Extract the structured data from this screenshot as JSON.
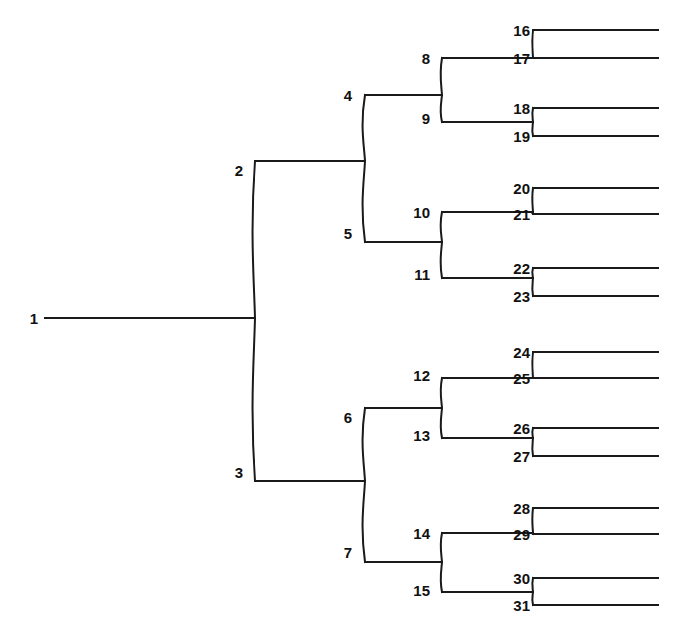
{
  "figure": {
    "kind": "binary-tree-diagram",
    "line_color": "#1a1a1a",
    "background_color": "#ffffff",
    "label_color": "#111111",
    "top_artifact_text": "a page of text cut off at the top edge"
  },
  "nodes": [
    {
      "id": "n1",
      "label": "1",
      "x": 45,
      "y": 318,
      "level": 0,
      "type": "root",
      "label_x": 38,
      "label_y": 318
    },
    {
      "id": "n2",
      "label": "2",
      "x": 255,
      "y": 161,
      "level": 1,
      "type": "internal",
      "label_x": 243,
      "label_y": 170
    },
    {
      "id": "n3",
      "label": "3",
      "x": 255,
      "y": 481,
      "level": 1,
      "type": "internal",
      "label_x": 243,
      "label_y": 472
    },
    {
      "id": "n4",
      "label": "4",
      "x": 365,
      "y": 95,
      "level": 2,
      "type": "internal",
      "label_x": 352,
      "label_y": 95
    },
    {
      "id": "n5",
      "label": "5",
      "x": 365,
      "y": 242,
      "level": 2,
      "type": "internal",
      "label_x": 352,
      "label_y": 233
    },
    {
      "id": "n6",
      "label": "6",
      "x": 365,
      "y": 408,
      "level": 2,
      "type": "internal",
      "label_x": 352,
      "label_y": 417
    },
    {
      "id": "n7",
      "label": "7",
      "x": 365,
      "y": 562,
      "level": 2,
      "type": "internal",
      "label_x": 352,
      "label_y": 552
    },
    {
      "id": "n8",
      "label": "8",
      "x": 442,
      "y": 58,
      "level": 3,
      "type": "internal",
      "label_x": 430,
      "label_y": 58
    },
    {
      "id": "n9",
      "label": "9",
      "x": 442,
      "y": 122,
      "level": 3,
      "type": "internal",
      "label_x": 430,
      "label_y": 118
    },
    {
      "id": "n10",
      "label": "10",
      "x": 442,
      "y": 212,
      "level": 3,
      "type": "internal",
      "label_x": 430,
      "label_y": 212
    },
    {
      "id": "n11",
      "label": "11",
      "x": 442,
      "y": 278,
      "level": 3,
      "type": "internal",
      "label_x": 430,
      "label_y": 274
    },
    {
      "id": "n12",
      "label": "12",
      "x": 442,
      "y": 378,
      "level": 3,
      "type": "internal",
      "label_x": 430,
      "label_y": 375
    },
    {
      "id": "n13",
      "label": "13",
      "x": 442,
      "y": 438,
      "level": 3,
      "type": "internal",
      "label_x": 430,
      "label_y": 435
    },
    {
      "id": "n14",
      "label": "14",
      "x": 442,
      "y": 533,
      "level": 3,
      "type": "internal",
      "label_x": 430,
      "label_y": 533
    },
    {
      "id": "n15",
      "label": "15",
      "x": 442,
      "y": 592,
      "level": 3,
      "type": "internal",
      "label_x": 430,
      "label_y": 590
    }
  ],
  "leaves": [
    {
      "id": "n16",
      "label": "16",
      "y": 30,
      "parent": "n8",
      "label_x": 530,
      "label_y": 30
    },
    {
      "id": "n17",
      "label": "17",
      "y": 58,
      "parent": "n8",
      "label_x": 530,
      "label_y": 58
    },
    {
      "id": "n18",
      "label": "18",
      "y": 108,
      "parent": "n9",
      "label_x": 530,
      "label_y": 108
    },
    {
      "id": "n19",
      "label": "19",
      "y": 136,
      "parent": "n9",
      "label_x": 530,
      "label_y": 136
    },
    {
      "id": "n20",
      "label": "20",
      "y": 188,
      "parent": "n10",
      "label_x": 530,
      "label_y": 188
    },
    {
      "id": "n21",
      "label": "21",
      "y": 214,
      "parent": "n10",
      "label_x": 530,
      "label_y": 214
    },
    {
      "id": "n22",
      "label": "22",
      "y": 268,
      "parent": "n11",
      "label_x": 530,
      "label_y": 268
    },
    {
      "id": "n23",
      "label": "23",
      "y": 296,
      "parent": "n11",
      "label_x": 530,
      "label_y": 296
    },
    {
      "id": "n24",
      "label": "24",
      "y": 352,
      "parent": "n12",
      "label_x": 530,
      "label_y": 352
    },
    {
      "id": "n25",
      "label": "25",
      "y": 378,
      "parent": "n12",
      "label_x": 530,
      "label_y": 378
    },
    {
      "id": "n26",
      "label": "26",
      "y": 428,
      "parent": "n13",
      "label_x": 530,
      "label_y": 428
    },
    {
      "id": "n27",
      "label": "27",
      "y": 456,
      "parent": "n13",
      "label_x": 530,
      "label_y": 456
    },
    {
      "id": "n28",
      "label": "28",
      "y": 508,
      "parent": "n14",
      "label_x": 530,
      "label_y": 508
    },
    {
      "id": "n29",
      "label": "29",
      "y": 534,
      "parent": "n14",
      "label_x": 530,
      "label_y": 534
    },
    {
      "id": "n30",
      "label": "30",
      "y": 578,
      "parent": "n15",
      "label_x": 530,
      "label_y": 578
    },
    {
      "id": "n31",
      "label": "31",
      "y": 605,
      "parent": "n15",
      "label_x": 530,
      "label_y": 605
    }
  ],
  "edges": [
    {
      "from": "1",
      "to": "2,3",
      "stem_x1": 45,
      "stem_x2": 255,
      "stem_y": 318,
      "bar_x": 255,
      "bar_y1": 161,
      "bar_y2": 481
    },
    {
      "from": "2",
      "to": "4,5",
      "stem_x1": 255,
      "stem_x2": 365,
      "stem_y": 161,
      "bar_x": 365,
      "bar_y1": 95,
      "bar_y2": 242
    },
    {
      "from": "3",
      "to": "6,7",
      "stem_x1": 255,
      "stem_x2": 365,
      "stem_y": 481,
      "bar_x": 365,
      "bar_y1": 408,
      "bar_y2": 562
    },
    {
      "from": "4",
      "to": "8,9",
      "stem_x1": 365,
      "stem_x2": 442,
      "stem_y": 95,
      "bar_x": 442,
      "bar_y1": 58,
      "bar_y2": 122
    },
    {
      "from": "5",
      "to": "10,11",
      "stem_x1": 365,
      "stem_x2": 442,
      "stem_y": 242,
      "bar_x": 442,
      "bar_y1": 212,
      "bar_y2": 278
    },
    {
      "from": "6",
      "to": "12,13",
      "stem_x1": 365,
      "stem_x2": 442,
      "stem_y": 408,
      "bar_x": 442,
      "bar_y1": 378,
      "bar_y2": 438
    },
    {
      "from": "7",
      "to": "14,15",
      "stem_x1": 365,
      "stem_x2": 442,
      "stem_y": 562,
      "bar_x": 442,
      "bar_y1": 533,
      "bar_y2": 592
    },
    {
      "from": "8",
      "to": "16,17",
      "stem_x1": 442,
      "stem_x2": 533,
      "stem_y": 58,
      "bar_x": 533,
      "bar_y1": 30,
      "bar_y2": 58
    },
    {
      "from": "9",
      "to": "18,19",
      "stem_x1": 442,
      "stem_x2": 533,
      "stem_y": 122,
      "bar_x": 533,
      "bar_y1": 108,
      "bar_y2": 136
    },
    {
      "from": "10",
      "to": "20,21",
      "stem_x1": 442,
      "stem_x2": 533,
      "stem_y": 212,
      "bar_x": 533,
      "bar_y1": 188,
      "bar_y2": 214
    },
    {
      "from": "11",
      "to": "22,23",
      "stem_x1": 442,
      "stem_x2": 533,
      "stem_y": 278,
      "bar_x": 533,
      "bar_y1": 268,
      "bar_y2": 296
    },
    {
      "from": "12",
      "to": "24,25",
      "stem_x1": 442,
      "stem_x2": 533,
      "stem_y": 378,
      "bar_x": 533,
      "bar_y1": 352,
      "bar_y2": 378
    },
    {
      "from": "13",
      "to": "26,27",
      "stem_x1": 442,
      "stem_x2": 533,
      "stem_y": 438,
      "bar_x": 533,
      "bar_y1": 428,
      "bar_y2": 456
    },
    {
      "from": "14",
      "to": "28,29",
      "stem_x1": 442,
      "stem_x2": 533,
      "stem_y": 533,
      "bar_x": 533,
      "bar_y1": 508,
      "bar_y2": 534
    },
    {
      "from": "15",
      "to": "30,31",
      "stem_x1": 442,
      "stem_x2": 533,
      "stem_y": 592,
      "bar_x": 533,
      "bar_y1": 578,
      "bar_y2": 605
    }
  ],
  "leaf_line": {
    "x1": 533,
    "x2": 658
  }
}
